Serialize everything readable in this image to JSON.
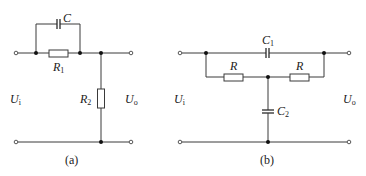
{
  "diagrams": [
    {
      "id": "a",
      "caption": "(a)",
      "labels": {
        "input": {
          "main": "U",
          "sub": "i"
        },
        "output": {
          "main": "U",
          "sub": "o"
        },
        "capacitor": {
          "main": "C",
          "sub": ""
        },
        "r1": {
          "main": "R",
          "sub": "1"
        },
        "r2": {
          "main": "R",
          "sub": "2"
        }
      },
      "components": [
        "C in parallel with R1 (series branch)",
        "R2 shunt to ground"
      ]
    },
    {
      "id": "b",
      "caption": "(b)",
      "labels": {
        "input": {
          "main": "U",
          "sub": "i"
        },
        "output": {
          "main": "U",
          "sub": "o"
        },
        "c1": {
          "main": "C",
          "sub": "1"
        },
        "c2": {
          "main": "C",
          "sub": "2"
        },
        "r_left": {
          "main": "R",
          "sub": ""
        },
        "r_right": {
          "main": "R",
          "sub": ""
        }
      },
      "components": [
        "C1 series bridge",
        "R-R series branch",
        "C2 shunt from R midpoint to ground"
      ]
    }
  ],
  "colors": {
    "wire": "#3a3a3a",
    "node": "#111111",
    "background": "#ffffff"
  }
}
